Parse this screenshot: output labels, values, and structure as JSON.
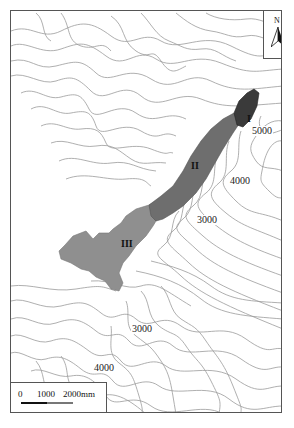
{
  "map": {
    "north_arrow": {
      "label": "N",
      "icon": "north-arrow-icon"
    },
    "scale_bar": {
      "ticks": [
        "0",
        "1000",
        "2000mm"
      ]
    },
    "contour_labels": [
      {
        "text": "5000",
        "x": 243,
        "y": 120
      },
      {
        "text": "4000",
        "x": 218,
        "y": 167
      },
      {
        "text": "3000",
        "x": 185,
        "y": 206
      },
      {
        "text": "3000",
        "x": 120,
        "y": 315
      },
      {
        "text": "4000",
        "x": 82,
        "y": 354
      }
    ],
    "zones": [
      {
        "label": "I",
        "color": "#3a3a3a"
      },
      {
        "label": "II",
        "color": "#6e6e6e"
      },
      {
        "label": "III",
        "color": "#8f8f8f"
      }
    ]
  }
}
